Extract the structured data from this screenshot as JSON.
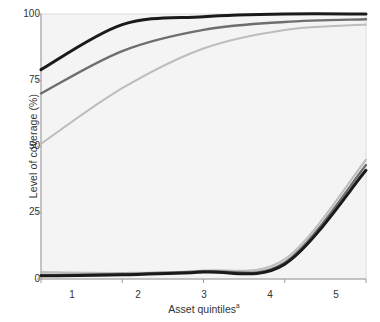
{
  "chart_data": {
    "type": "line",
    "title": "",
    "xlabel": "Asset quintiles",
    "xlabel_superscript": "a",
    "ylabel": "Level of coverage (%)",
    "xlim": [
      1,
      5
    ],
    "ylim": [
      0,
      100
    ],
    "x": [
      1,
      2,
      3,
      4,
      5
    ],
    "xtick_labels": [
      "1",
      "2",
      "3",
      "4",
      "5"
    ],
    "ytick_labels": [
      "0",
      "25",
      "50",
      "75",
      "100"
    ],
    "ytick_values": [
      0,
      25,
      50,
      75,
      100
    ],
    "grid": false,
    "legend_position": "upper right",
    "annotations": [
      {
        "text": "Brazil 1996",
        "x": 2.35,
        "y": 63
      },
      {
        "text": "Ethiopia 2000",
        "x": 3.75,
        "y": 17
      }
    ],
    "groups": [
      {
        "name": "Brazil 1996",
        "series": [
          {
            "name": "≥ 4 Antenatal care visits",
            "color": "#bdbdbd",
            "values": [
              51,
              72,
              87,
              94,
              96
            ]
          },
          {
            "name": "Birth in a health facility",
            "color": "#1a1a1a",
            "values": [
              79,
              96,
              99,
              100,
              100
            ]
          },
          {
            "name": "Skilled attendance at birth",
            "color": "#6e6e6e",
            "values": [
              70,
              86,
              94,
              97,
              98
            ]
          }
        ]
      },
      {
        "name": "Ethiopia 2000",
        "series": [
          {
            "name": "≥ 4 Antenatal care visits",
            "color": "#bdbdbd",
            "values": [
              2.6,
              2.3,
              3.2,
              7.5,
              45
            ]
          },
          {
            "name": "Birth in a health facility",
            "color": "#1a1a1a",
            "values": [
              1.2,
              1.6,
              2.6,
              5.6,
              41
            ]
          },
          {
            "name": "Skilled attendance at birth",
            "color": "#6e6e6e",
            "values": [
              1.5,
              1.9,
              2.9,
              6.2,
              43
            ]
          }
        ]
      }
    ],
    "legend": [
      {
        "label": "≥ 4 Antenatal care visits",
        "color": "#bdbdbd",
        "width": 2.0
      },
      {
        "label": "Birth in a health facility",
        "color": "#1a1a1a",
        "width": 3.0
      },
      {
        "label": "Skilled attendance at birth",
        "color": "#6e6e6e",
        "width": 2.4
      }
    ],
    "colors": {
      "plot_background": "#f4f4f4",
      "page_background": "#ffffff",
      "axis": "#9a9a9a",
      "text": "#333333",
      "antenatal": "#bdbdbd",
      "facility": "#1a1a1a",
      "skilled": "#6e6e6e"
    }
  }
}
